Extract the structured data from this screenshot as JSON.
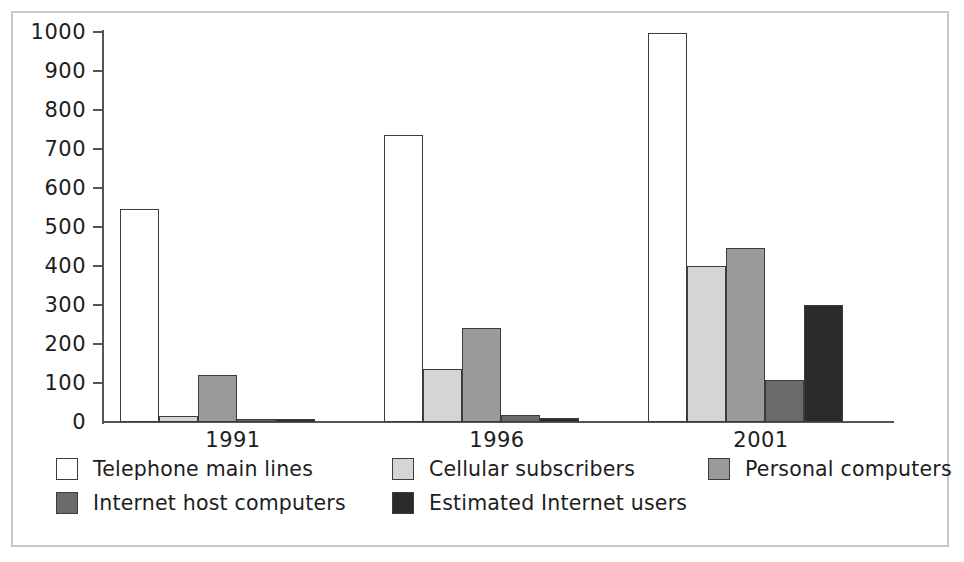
{
  "chart_data": {
    "type": "bar",
    "title": "",
    "subtitle": "",
    "xlabel": "",
    "ylabel": "",
    "categories": [
      "1991",
      "1996",
      "2001"
    ],
    "ylim": [
      0,
      1000
    ],
    "yticks": [
      0,
      100,
      200,
      300,
      400,
      500,
      600,
      700,
      800,
      900,
      1000
    ],
    "ytick_labels": [
      "0",
      "100",
      "200",
      "300",
      "400",
      "500",
      "600",
      "700",
      "800",
      "900",
      "1000"
    ],
    "grid": false,
    "legend_position": "bottom",
    "series": [
      {
        "name": "Telephone main lines",
        "color": "#ffffff",
        "values": [
          545,
          735,
          998
        ]
      },
      {
        "name": "Cellular subscribers",
        "color": "#d5d5d5",
        "values": [
          16,
          135,
          400
        ]
      },
      {
        "name": "Personal computers",
        "color": "#9a9a9a",
        "values": [
          120,
          242,
          445
        ]
      },
      {
        "name": "Internet host computers",
        "color": "#6b6b6b",
        "values": [
          7,
          18,
          107
        ]
      },
      {
        "name": "Estimated Internet users",
        "color": "#2b2b2b",
        "values": [
          5,
          10,
          299
        ]
      }
    ]
  },
  "axis": {
    "tick_0": "0",
    "tick_1": "100",
    "tick_2": "200",
    "tick_3": "300",
    "tick_4": "400",
    "tick_5": "500",
    "tick_6": "600",
    "tick_7": "700",
    "tick_8": "800",
    "tick_9": "900",
    "tick_10": "1000"
  },
  "xaxis": {
    "label_0": "1991",
    "label_1": "1996",
    "label_2": "2001"
  },
  "legend": {
    "items": [
      {
        "label": "Telephone main lines",
        "color": "#ffffff"
      },
      {
        "label": "Cellular subscribers",
        "color": "#d5d5d5"
      },
      {
        "label": "Personal computers",
        "color": "#9a9a9a"
      },
      {
        "label": "Internet host computers",
        "color": "#6b6b6b"
      },
      {
        "label": "Estimated Internet users",
        "color": "#2b2b2b"
      }
    ]
  }
}
